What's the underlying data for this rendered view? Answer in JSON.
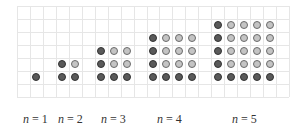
{
  "figure": {
    "grid": {
      "left": 17,
      "top": 6,
      "cell": 12.95,
      "cols": 21,
      "rows": 7,
      "line_color": "#e6e6e6"
    },
    "colors": {
      "dark_fill": "#5a5a5a",
      "dark_border": "#333333",
      "light_fill": "#c4c4c4",
      "light_border": "#6a6a6a"
    },
    "patterns": [
      {
        "n": 1,
        "start_col": 1,
        "label": "n = 1",
        "label_x": 23
      },
      {
        "n": 2,
        "start_col": 3,
        "label": "n = 2",
        "label_x": 58
      },
      {
        "n": 3,
        "start_col": 6,
        "label": "n = 3",
        "label_x": 101
      },
      {
        "n": 4,
        "start_col": 10,
        "label": "n = 4",
        "label_x": 157
      },
      {
        "n": 5,
        "start_col": 15,
        "label": "n = 5",
        "label_x": 232
      }
    ],
    "bottom_row": 5
  },
  "labels": {
    "n1": {
      "var": "n",
      "eq": " = 1"
    },
    "n2": {
      "var": "n",
      "eq": " = 2"
    },
    "n3": {
      "var": "n",
      "eq": " = 3"
    },
    "n4": {
      "var": "n",
      "eq": " = 4"
    },
    "n5": {
      "var": "n",
      "eq": " = 5"
    }
  }
}
